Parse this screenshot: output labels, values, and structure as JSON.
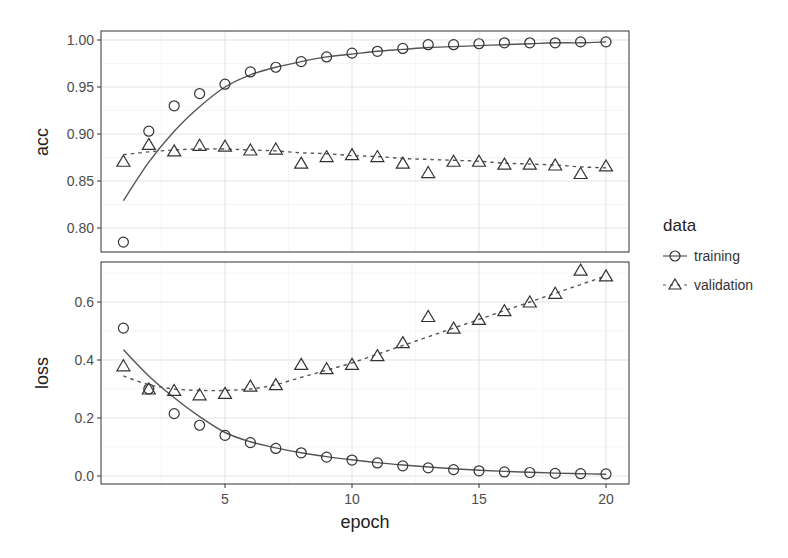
{
  "chart_data": {
    "type": "line",
    "title": "",
    "xlabel": "epoch",
    "x": [
      1,
      2,
      3,
      4,
      5,
      6,
      7,
      8,
      9,
      10,
      11,
      12,
      13,
      14,
      15,
      16,
      17,
      18,
      19,
      20
    ],
    "x_ticks": [
      5,
      10,
      15,
      20
    ],
    "x_tick_labels": [
      "5",
      "10",
      "15",
      "20"
    ],
    "xlim": [
      0.3,
      21
    ],
    "grid": true,
    "legend": {
      "title": "data",
      "position": "right",
      "entries": [
        {
          "label": "training",
          "marker": "circle",
          "line": "solid"
        },
        {
          "label": "validation",
          "marker": "triangle",
          "line": "dashed"
        }
      ]
    },
    "panels": [
      {
        "ylabel": "acc",
        "ylim": [
          0.777,
          1.012
        ],
        "y_ticks": [
          0.8,
          0.85,
          0.9,
          0.95,
          1.0
        ],
        "y_tick_labels": [
          "0.80",
          "0.85",
          "0.90",
          "0.95",
          "1.00"
        ],
        "series": [
          {
            "name": "training",
            "values": [
              0.785,
              0.903,
              0.93,
              0.943,
              0.953,
              0.966,
              0.971,
              0.977,
              0.982,
              0.986,
              0.988,
              0.991,
              0.995,
              0.995,
              0.996,
              0.997,
              0.997,
              0.997,
              0.998,
              0.998
            ],
            "smooth": [
              0.829,
              0.87,
              0.903,
              0.929,
              0.95,
              0.963,
              0.971,
              0.977,
              0.982,
              0.985,
              0.988,
              0.99,
              0.992,
              0.993,
              0.994,
              0.995,
              0.996,
              0.997,
              0.997,
              0.998
            ]
          },
          {
            "name": "validation",
            "values": [
              0.871,
              0.889,
              0.882,
              0.888,
              0.887,
              0.883,
              0.884,
              0.869,
              0.876,
              0.878,
              0.876,
              0.869,
              0.859,
              0.871,
              0.871,
              0.868,
              0.868,
              0.867,
              0.858,
              0.866
            ],
            "smooth": [
              0.878,
              0.881,
              0.883,
              0.884,
              0.884,
              0.883,
              0.882,
              0.88,
              0.879,
              0.877,
              0.876,
              0.874,
              0.873,
              0.872,
              0.871,
              0.869,
              0.868,
              0.867,
              0.865,
              0.864
            ]
          }
        ]
      },
      {
        "ylabel": "loss",
        "ylim": [
          -0.03,
          0.735
        ],
        "y_ticks": [
          0.0,
          0.2,
          0.4,
          0.6
        ],
        "y_tick_labels": [
          "0.0",
          "0.2",
          "0.4",
          "0.6"
        ],
        "series": [
          {
            "name": "training",
            "values": [
              0.51,
              0.3,
              0.215,
              0.175,
              0.14,
              0.115,
              0.095,
              0.08,
              0.065,
              0.055,
              0.045,
              0.035,
              0.028,
              0.022,
              0.018,
              0.014,
              0.012,
              0.009,
              0.008,
              0.007
            ],
            "smooth": [
              0.435,
              0.345,
              0.27,
              0.205,
              0.15,
              0.118,
              0.097,
              0.08,
              0.067,
              0.056,
              0.046,
              0.038,
              0.031,
              0.025,
              0.02,
              0.016,
              0.013,
              0.01,
              0.008,
              0.006
            ]
          },
          {
            "name": "validation",
            "values": [
              0.38,
              0.3,
              0.295,
              0.28,
              0.285,
              0.31,
              0.315,
              0.385,
              0.37,
              0.385,
              0.415,
              0.46,
              0.55,
              0.51,
              0.54,
              0.57,
              0.6,
              0.63,
              0.71,
              0.69
            ],
            "smooth": [
              0.345,
              0.315,
              0.3,
              0.295,
              0.295,
              0.3,
              0.315,
              0.34,
              0.365,
              0.39,
              0.42,
              0.45,
              0.48,
              0.51,
              0.54,
              0.57,
              0.6,
              0.63,
              0.66,
              0.69
            ]
          }
        ]
      }
    ]
  },
  "colors": {
    "line": "#555555",
    "marker": "#333333",
    "grid": "#e6e6e6",
    "panel_border": "#333333",
    "text": "#4d4d4d"
  }
}
